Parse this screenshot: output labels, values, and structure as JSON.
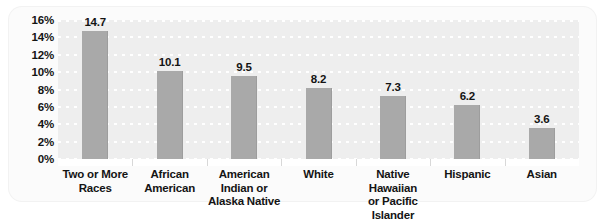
{
  "chart_data": {
    "type": "bar",
    "title": "",
    "subtitle": "",
    "xlabel": "",
    "ylabel": "",
    "categories": [
      "Two or More\nRaces",
      "African\nAmerican",
      "American\nIndian or\nAlaska Native",
      "White",
      "Native Hawaiian\nor Pacific Islander",
      "Hispanic",
      "Asian"
    ],
    "values": [
      14.7,
      10.1,
      9.5,
      8.2,
      7.3,
      6.2,
      3.6
    ],
    "data_labels": [
      "14.7",
      "10.1",
      "9.5",
      "8.2",
      "7.3",
      "6.2",
      "3.6"
    ],
    "ylim": [
      0,
      16
    ],
    "ytick_values": [
      0,
      2,
      4,
      6,
      8,
      10,
      12,
      14,
      16
    ],
    "ytick_labels": [
      "0%",
      "2%",
      "4%",
      "6%",
      "8%",
      "10%",
      "12%",
      "14%",
      "16%"
    ],
    "grid": true,
    "grid_style": "dotted-white-horizontal",
    "legend": null,
    "legend_position": "none",
    "colors": {
      "bar_fill": "#a9a9a9",
      "plot_background": "#eeeeee",
      "panel_background": "#fbfbfb",
      "gridline": "#ffffff",
      "text": "#141414",
      "axis_band": "#ffffff"
    }
  }
}
